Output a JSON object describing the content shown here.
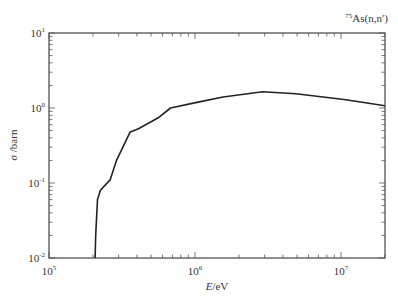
{
  "chart_data": {
    "type": "line",
    "title_parts": {
      "mass": "75",
      "rest": "As(n,n′)"
    },
    "xlabel": "E/eV",
    "ylabel": "σ /barn",
    "xscale": "log",
    "yscale": "log",
    "xlim": [
      100000,
      20000000
    ],
    "ylim": [
      0.01,
      10
    ],
    "x_ticks": [
      {
        "base": "10",
        "exp": "5",
        "value": 100000
      },
      {
        "base": "10",
        "exp": "6",
        "value": 1000000
      },
      {
        "base": "10",
        "exp": "7",
        "value": 10000000
      }
    ],
    "y_ticks": [
      {
        "base": "10",
        "exp": "1",
        "value": 10
      },
      {
        "base": "10",
        "exp": "0",
        "value": 1
      },
      {
        "base": "10",
        "exp": "-1",
        "value": 0.1
      },
      {
        "base": "10",
        "exp": "-2",
        "value": 0.01
      }
    ],
    "grid": false,
    "legend": "none",
    "series": [
      {
        "name": "75As(n,n')",
        "color": "#222222",
        "x": [
          207000,
          209000,
          215000,
          225000,
          262000,
          290000,
          360000,
          410000,
          560000,
          680000,
          1050000,
          1560000,
          2900000,
          4900000,
          10500000,
          20000000
        ],
        "y": [
          0.01,
          0.02,
          0.06,
          0.08,
          0.11,
          0.2,
          0.48,
          0.53,
          0.74,
          1.0,
          1.2,
          1.4,
          1.65,
          1.55,
          1.3,
          1.07
        ]
      }
    ]
  }
}
